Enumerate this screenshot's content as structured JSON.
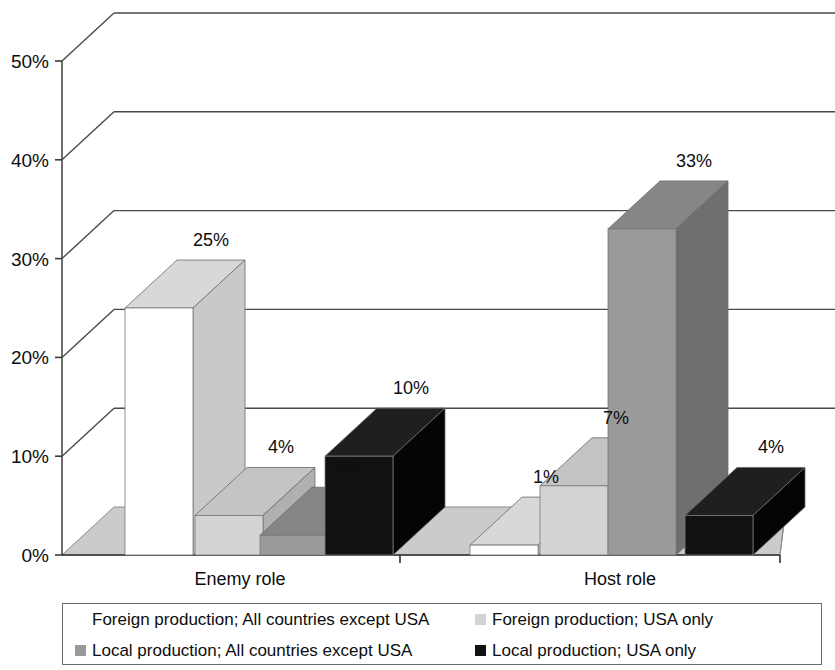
{
  "chart_data": {
    "type": "bar",
    "title": "",
    "subtitle": "",
    "xlabel": "",
    "ylabel": "",
    "categories": [
      "Enemy role",
      "Host role"
    ],
    "ylim": [
      0,
      50
    ],
    "ytick_values": [
      0,
      10,
      20,
      30,
      40,
      50
    ],
    "ytick_labels": [
      "0%",
      "10%",
      "20%",
      "30%",
      "40%",
      "50%"
    ],
    "grid": true,
    "three_d": true,
    "legend_position": "bottom",
    "value_label_suffix": "%",
    "series": [
      {
        "name": "Foreign production; All countries except USA",
        "color": "#ffffff",
        "side_color": "#c9c9c9",
        "top_color": "#d8d8d8",
        "values": [
          25,
          1
        ],
        "labels": [
          "25%",
          "1%"
        ]
      },
      {
        "name": "Foreign production; USA only",
        "color": "#d3d3d3",
        "side_color": "#b0b0b0",
        "top_color": "#c4c4c4",
        "values": [
          4,
          7
        ],
        "labels": [
          "4%",
          "7%"
        ]
      },
      {
        "name": "Local production; All countries except USA",
        "color": "#9a9a9a",
        "side_color": "#6f6f6f",
        "top_color": "#868686",
        "values": [
          2,
          33
        ],
        "labels": [
          "2%",
          "33%"
        ]
      },
      {
        "name": "Local production; USA only",
        "color": "#111111",
        "side_color": "#050505",
        "top_color": "#1f1f1f",
        "values": [
          10,
          4
        ],
        "labels": [
          "10%",
          "4%"
        ]
      }
    ]
  },
  "axis": {
    "y_ticks": [
      "0%",
      "10%",
      "20%",
      "30%",
      "40%",
      "50%"
    ],
    "categories": [
      "Enemy role",
      "Host role"
    ]
  },
  "legend": {
    "entries": [
      {
        "label": "Foreign production; All countries except USA",
        "color": "#ffffff"
      },
      {
        "label": "Foreign production; USA only",
        "color": "#d3d3d3"
      },
      {
        "label": "Local production; All countries except USA",
        "color": "#9a9a9a"
      },
      {
        "label": "Local production; USA only",
        "color": "#111111"
      }
    ]
  },
  "data_labels": {
    "enemy": [
      "25%",
      "4%",
      "2%",
      "10%"
    ],
    "host": [
      "1%",
      "7%",
      "33%",
      "4%"
    ]
  }
}
